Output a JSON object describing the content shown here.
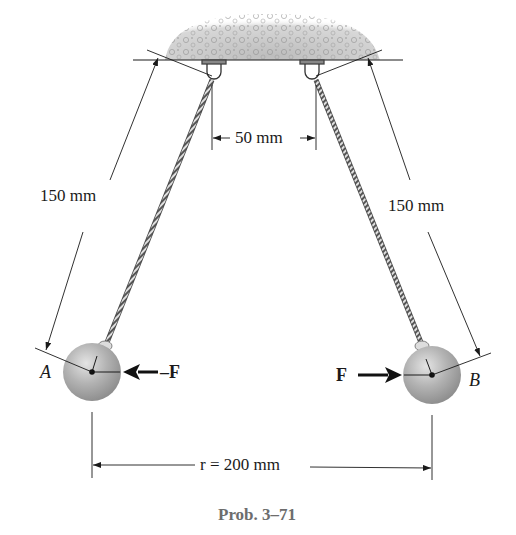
{
  "figure": {
    "caption": "Prob. 3–71",
    "ceiling": {
      "type": "concrete-support"
    },
    "dimensions": {
      "left_cord_length": "150 mm",
      "right_cord_length": "150 mm",
      "support_spacing": "50 mm",
      "ball_separation": "r = 200 mm"
    },
    "balls": [
      {
        "label": "A",
        "force_label": "–F",
        "force_direction": "left"
      },
      {
        "label": "B",
        "force_label": "F",
        "force_direction": "right"
      }
    ],
    "colors": {
      "ink": "#1a1a1a",
      "ball": "#a8a8a8",
      "ceiling": "#c8c8c8",
      "caption": "#6d6d6d"
    }
  }
}
